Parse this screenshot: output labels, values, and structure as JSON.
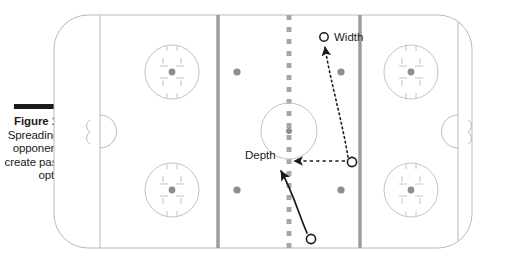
{
  "figure": {
    "label": "Figure 10-2:",
    "caption": "Spreading out opponents to create passing options.",
    "rule_color": "#1a1a1a"
  },
  "diagram": {
    "type": "ice-hockey-rink-play-diagram",
    "sport": "ice hockey",
    "colors": {
      "ice": "#ffffff",
      "rink_outline": "#b9b9bd",
      "faceoff_markings": "#c3c3c7",
      "blue_line": "#9b9b9f",
      "center_line": "#a8a8ac",
      "faceoff_dot": "#8e8e92",
      "player_marker_outline": "#1a1a1a",
      "arrow": "#1a1a1a"
    },
    "annotations": [
      {
        "name": "width",
        "label": "Width"
      },
      {
        "name": "depth",
        "label": "Depth"
      }
    ],
    "players": [
      {
        "name": "player-top-right",
        "x": 324,
        "y": 37,
        "style": "open-circle"
      },
      {
        "name": "player-mid-right",
        "x": 352,
        "y": 162,
        "style": "open-circle"
      },
      {
        "name": "player-bottom-center",
        "x": 311,
        "y": 239,
        "style": "open-circle"
      }
    ],
    "arrows": [
      {
        "name": "width-pass-arrow",
        "style": "dotted",
        "from": "player-mid-right",
        "to": "player-top-right"
      },
      {
        "name": "depth-pass-arrow",
        "style": "dashed",
        "from": "player-mid-right",
        "to": "depth-label"
      },
      {
        "name": "skating-path-arrow",
        "style": "solid-curved",
        "from": "player-bottom-center",
        "to": "depth-label"
      }
    ],
    "rink_features": [
      "goal-line-left",
      "goal-line-right",
      "goal-crease-left",
      "goal-crease-right",
      "blue-line-left",
      "blue-line-right",
      "center-line-dashed",
      "center-ice-circle",
      "faceoff-circle-top-left",
      "faceoff-circle-bottom-left",
      "faceoff-circle-top-right",
      "faceoff-circle-bottom-right",
      "neutral-zone-dots"
    ]
  }
}
